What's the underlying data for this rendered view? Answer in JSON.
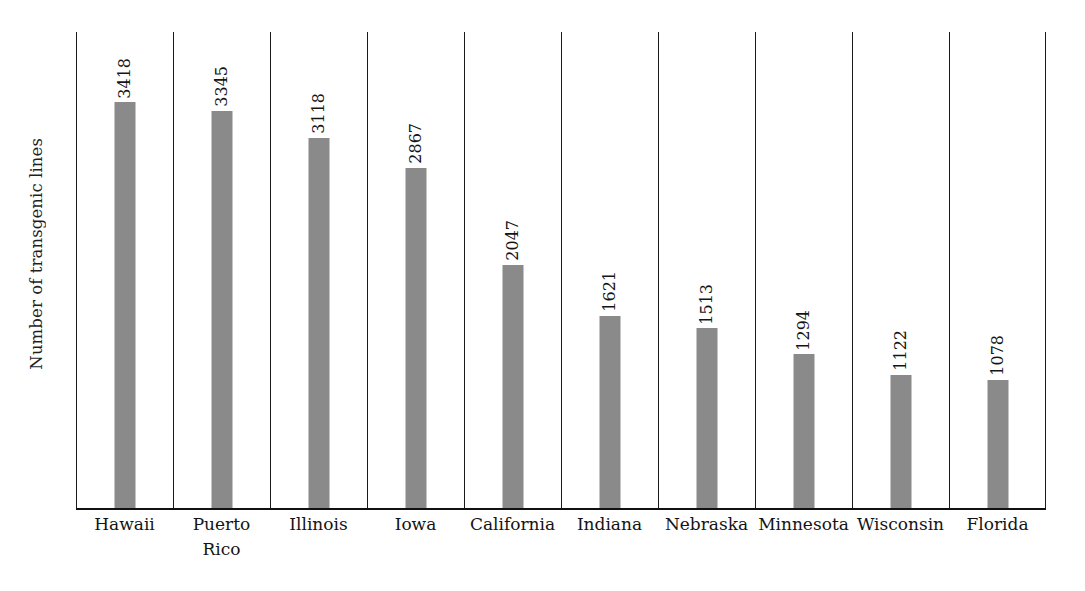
{
  "chart_data": {
    "type": "bar",
    "title": "",
    "subtitle": "",
    "xlabel": "",
    "ylabel": "Number of transgenic lines",
    "orientation": "vertical",
    "grid": false,
    "legend": false,
    "legend_position": "none",
    "axis_tick_labels_y": [],
    "ylim": [
      0,
      4010
    ],
    "bar_color": "#8a8a8a",
    "axis_color": "#1a1a1a",
    "value_label_rotation": 90,
    "categories": [
      "Hawaii",
      "Puerto Rico",
      "Illinois",
      "Iowa",
      "California",
      "Indiana",
      "Nebraska",
      "Minnesota",
      "Wisconsin",
      "Florida"
    ],
    "values": [
      3418,
      3345,
      3118,
      2867,
      2047,
      1621,
      1513,
      1294,
      1122,
      1078
    ],
    "points": [
      {
        "category": "Hawaii",
        "line1": "Hawaii",
        "line2": "",
        "value": 3418,
        "value_label": "3418"
      },
      {
        "category": "Puerto Rico",
        "line1": "Puerto",
        "line2": "Rico",
        "value": 3345,
        "value_label": "3345"
      },
      {
        "category": "Illinois",
        "line1": "Illinois",
        "line2": "",
        "value": 3118,
        "value_label": "3118"
      },
      {
        "category": "Iowa",
        "line1": "Iowa",
        "line2": "",
        "value": 2867,
        "value_label": "2867"
      },
      {
        "category": "California",
        "line1": "California",
        "line2": "",
        "value": 2047,
        "value_label": "2047"
      },
      {
        "category": "Indiana",
        "line1": "Indiana",
        "line2": "",
        "value": 1621,
        "value_label": "1621"
      },
      {
        "category": "Nebraska",
        "line1": "Nebraska",
        "line2": "",
        "value": 1513,
        "value_label": "1513"
      },
      {
        "category": "Minnesota",
        "line1": "Minnesota",
        "line2": "",
        "value": 1294,
        "value_label": "1294"
      },
      {
        "category": "Wisconsin",
        "line1": "Wisconsin",
        "line2": "",
        "value": 1122,
        "value_label": "1122"
      },
      {
        "category": "Florida",
        "line1": "Florida",
        "line2": "",
        "value": 1078,
        "value_label": "1078"
      }
    ]
  }
}
